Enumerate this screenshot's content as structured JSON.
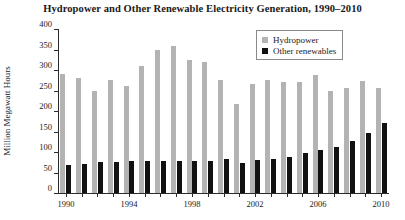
{
  "chart_data": {
    "type": "bar",
    "title": "Hydropower and Other Renewable Electricity Generation, 1990–2010",
    "xlabel": "",
    "ylabel": "Million Megawatt Hours",
    "ylim": [
      0,
      400
    ],
    "ytick_step": 50,
    "grid": false,
    "legend_position": "top-right",
    "categories": [
      "1990",
      "1991",
      "1992",
      "1993",
      "1994",
      "1995",
      "1996",
      "1997",
      "1998",
      "1999",
      "2000",
      "2001",
      "2002",
      "2003",
      "2004",
      "2005",
      "2006",
      "2007",
      "2008",
      "2009",
      "2010"
    ],
    "xtick_labels": [
      "1990",
      "1994",
      "1998",
      "2002",
      "2006",
      "2010"
    ],
    "ytick_labels": [
      "0",
      "50",
      "100",
      "150",
      "200",
      "250",
      "300",
      "350",
      "400"
    ],
    "series": [
      {
        "name": "Hydropower",
        "color": "#b3b3b3",
        "values": [
          290,
          281,
          248,
          276,
          261,
          311,
          350,
          358,
          324,
          320,
          276,
          217,
          265,
          276,
          270,
          270,
          289,
          248,
          255,
          273,
          257
        ]
      },
      {
        "name": "Other renewables",
        "color": "#111111",
        "values": [
          68,
          70,
          76,
          76,
          77,
          77,
          78,
          78,
          78,
          79,
          82,
          74,
          80,
          82,
          89,
          97,
          106,
          112,
          127,
          147,
          170
        ]
      }
    ]
  },
  "legend": {
    "items": [
      {
        "label": "Hydropower"
      },
      {
        "label": "Other renewables"
      }
    ]
  }
}
